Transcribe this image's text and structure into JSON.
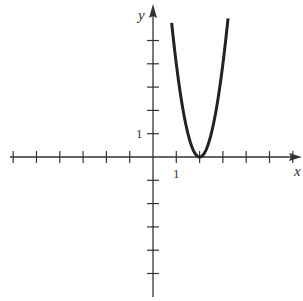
{
  "chart_data": {
    "type": "line",
    "title": "",
    "xlabel": "x",
    "ylabel": "y",
    "tick_labels": {
      "x": "1",
      "y": "1"
    },
    "xlim": [
      -6.5,
      6.3
    ],
    "ylim": [
      -5.8,
      6.4
    ],
    "x_ticks": [
      -6,
      -5,
      -4,
      -3,
      -2,
      -1,
      1,
      2,
      3,
      4,
      5,
      6
    ],
    "y_ticks": [
      -5,
      -4,
      -3,
      -2,
      -1,
      1,
      2,
      3,
      4,
      5
    ],
    "grid": false,
    "legend": null,
    "series": [
      {
        "name": "parabola",
        "equation": "y = 4(x - 2)^2",
        "vertex": [
          2,
          0
        ],
        "x": [
          0.8,
          1.0,
          1.25,
          1.5,
          1.75,
          2.0,
          2.25,
          2.5,
          2.75,
          3.0,
          3.2
        ],
        "y": [
          5.76,
          4.0,
          2.25,
          1.0,
          0.25,
          0.0,
          0.25,
          1.0,
          2.25,
          4.0,
          5.76
        ]
      }
    ]
  },
  "colors": {
    "axis": "#333333",
    "curve": "#222222"
  }
}
